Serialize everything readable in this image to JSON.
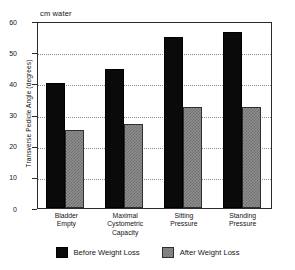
{
  "chart_data": {
    "type": "bar",
    "title": "",
    "subtitle": "",
    "annotation": "cm water",
    "xlabel": "",
    "ylabel": "Transverse Pedicle Angle (degrees)",
    "ylim": [
      0,
      60
    ],
    "ytick_labels": [
      "60",
      "50",
      "40",
      "30",
      "20",
      "10",
      "0"
    ],
    "ytick_values": [
      60,
      50,
      40,
      30,
      20,
      10,
      0
    ],
    "gridlines": [
      50,
      40,
      30,
      20,
      10
    ],
    "grid": true,
    "grid_style": "dotted",
    "legend_position": "bottom-outside",
    "categories": [
      "Bladder\nEmpty",
      "Maximal\nCystometric\nCapacity",
      "Sitting\nPressure",
      "Standing\nPressure"
    ],
    "category_lines": [
      [
        "Bladder",
        "Empty"
      ],
      [
        "Maximal",
        "Cystometric",
        "Capacity"
      ],
      [
        "Sitting",
        "Pressure"
      ],
      [
        "Standing",
        "Pressure"
      ]
    ],
    "series": [
      {
        "name": "Before Weight Loss",
        "color": "#0a0a0a",
        "fill": "solid-black",
        "values": [
          40,
          44.5,
          55,
          56.5
        ]
      },
      {
        "name": "After Weight Loss",
        "color": "#8e8e8e",
        "fill": "checkered-gray",
        "values": [
          25,
          27,
          32.5,
          32.5
        ]
      }
    ]
  },
  "legend": {
    "items": [
      {
        "label": "Before Weight Loss",
        "swatch": "black"
      },
      {
        "label": "After Weight Loss",
        "swatch": "gray"
      }
    ]
  }
}
